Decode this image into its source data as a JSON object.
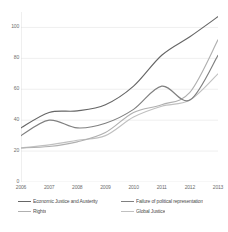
{
  "chart_data": {
    "type": "line",
    "title": "",
    "xlabel": "",
    "ylabel": "",
    "categories": [
      "2006",
      "2007",
      "2008",
      "2009",
      "2010",
      "2011",
      "2012",
      "2013"
    ],
    "x": [
      2006,
      2007,
      2008,
      2009,
      2010,
      2011,
      2012,
      2013
    ],
    "ylim": [
      0,
      110
    ],
    "xlim": [
      2006,
      2013
    ],
    "yticks": [
      0,
      20,
      40,
      60,
      80,
      100
    ],
    "ytick_labels": [
      "0",
      "20",
      "40",
      "60",
      "80",
      "100"
    ],
    "grid": true,
    "grid_axis": "y",
    "legend_position": "bottom",
    "legend_columns": 2,
    "series": [
      {
        "name": "Economic Justice and Austerity",
        "color": "#666666",
        "values": [
          35,
          45,
          46,
          50,
          62,
          82,
          94,
          107
        ]
      },
      {
        "name": "Failure of political representation",
        "color": "#808080",
        "values": [
          30,
          40,
          35,
          38,
          47,
          62,
          53,
          82
        ]
      },
      {
        "name": "Rights",
        "color": "#b0b0b0",
        "values": [
          22,
          23,
          26,
          32,
          45,
          50,
          58,
          92
        ]
      },
      {
        "name": "Global Justice",
        "color": "#c0c0c0",
        "values": [
          22,
          24,
          27,
          30,
          42,
          49,
          53,
          70
        ]
      }
    ]
  },
  "caption": {
    "text": ""
  }
}
